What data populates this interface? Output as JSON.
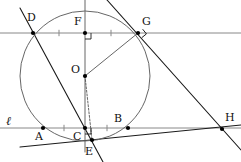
{
  "figure": {
    "width": 241,
    "height": 162,
    "background": "#ffffff",
    "stroke_dark": "#1a1a1a",
    "stroke_mid": "#555555",
    "stroke_light": "#888888",
    "point_fill": "#000000"
  },
  "circle": {
    "name": "circle-o",
    "center_label": "O",
    "cx": 85,
    "cy": 76,
    "r": 65,
    "stroke": "#666666"
  },
  "points": [
    {
      "id": "D",
      "label": "D",
      "x": 33,
      "y": 33,
      "label_x": 27,
      "label_y": 12
    },
    {
      "id": "F",
      "label": "F",
      "x": 85,
      "y": 33,
      "label_x": 74,
      "label_y": 16
    },
    {
      "id": "G",
      "label": "G",
      "x": 138,
      "y": 33,
      "label_x": 142,
      "label_y": 16
    },
    {
      "id": "O",
      "label": "O",
      "x": 85,
      "y": 76,
      "label_x": 71,
      "label_y": 64
    },
    {
      "id": "A",
      "label": "A",
      "x": 43,
      "y": 128,
      "label_x": 35,
      "label_y": 131
    },
    {
      "id": "C",
      "label": "C",
      "x": 85,
      "y": 128,
      "label_x": 73,
      "label_y": 131
    },
    {
      "id": "B",
      "label": "B",
      "x": 128,
      "y": 128,
      "label_x": 114,
      "label_y": 113
    },
    {
      "id": "H",
      "label": "H",
      "x": 222,
      "y": 129,
      "label_x": 225,
      "label_y": 112
    },
    {
      "id": "E",
      "label": "E",
      "x": 92,
      "y": 140,
      "label_x": 85,
      "label_y": 146
    }
  ],
  "line_labels": [
    {
      "id": "ell",
      "label": "ℓ",
      "x": 6,
      "y": 115
    }
  ],
  "segments": [
    {
      "name": "line-ell-horizontal",
      "x1": 0,
      "y1": 128,
      "x2": 241,
      "y2": 128,
      "weight": "light"
    },
    {
      "name": "line-fg-horizontal",
      "x1": 0,
      "y1": 33,
      "x2": 241,
      "y2": 33,
      "weight": "light"
    },
    {
      "name": "line-de-through-circle",
      "x1": 20,
      "y1": 8,
      "x2": 103,
      "y2": 162,
      "weight": "dark"
    },
    {
      "name": "line-ch-tangent-bottom",
      "x1": 20,
      "y1": 147,
      "x2": 241,
      "y2": 125,
      "weight": "dark"
    },
    {
      "name": "line-gh-tangent",
      "x1": 107,
      "y1": 0,
      "x2": 241,
      "y2": 150,
      "weight": "dark"
    },
    {
      "name": "segment-oc-vertical",
      "x1": 85,
      "y1": 0,
      "x2": 85,
      "y2": 152,
      "weight": "mid"
    },
    {
      "name": "segment-og-radius",
      "x1": 85,
      "y1": 76,
      "x2": 138,
      "y2": 33,
      "weight": "mid"
    },
    {
      "name": "segment-oe-dashed",
      "x1": 85,
      "y1": 76,
      "x2": 92,
      "y2": 140,
      "weight": "dash"
    }
  ],
  "right_angle_marks": [
    {
      "name": "right-angle-at-f",
      "x": 85,
      "y": 33,
      "rotation": 0
    },
    {
      "name": "right-angle-at-c",
      "x": 85,
      "y": 128,
      "rotation": 0
    },
    {
      "name": "right-angle-at-g",
      "x": 138,
      "y": 33,
      "rotation": -39
    }
  ],
  "tick_marks": [
    {
      "name": "tick-df-midpoint",
      "x": 59,
      "y": 33
    },
    {
      "name": "tick-fg-midpoint",
      "x": 111,
      "y": 33
    },
    {
      "name": "tick-ac-midpoint",
      "x": 64,
      "y": 128
    },
    {
      "name": "tick-cb-midpoint",
      "x": 107,
      "y": 128
    }
  ]
}
